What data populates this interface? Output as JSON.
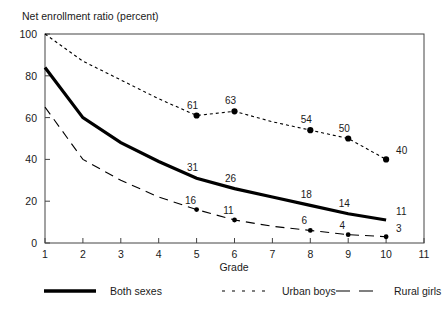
{
  "chart_data": {
    "type": "line",
    "title": "Net enrollment ratio (percent)",
    "xlabel": "Grade",
    "ylabel": "",
    "xlim": [
      1,
      11
    ],
    "ylim": [
      0,
      100
    ],
    "xticks": [
      "1",
      "2",
      "3",
      "4",
      "5",
      "6",
      "7",
      "8",
      "9",
      "10",
      "11"
    ],
    "yticks": [
      "0",
      "20",
      "40",
      "60",
      "80",
      "100"
    ],
    "grid": false,
    "legend_position": "bottom",
    "x": [
      1,
      2,
      3,
      4,
      5,
      6,
      7,
      8,
      9,
      10
    ],
    "series": [
      {
        "name": "Both sexes",
        "style": "solid",
        "width": "thick",
        "color": "#000000",
        "markers": false,
        "values": [
          84,
          60,
          48,
          39,
          31,
          26,
          22,
          18,
          14,
          11
        ],
        "labels": [
          {
            "x": 5,
            "value": 31
          },
          {
            "x": 6,
            "value": 26
          },
          {
            "x": 8,
            "value": 18
          },
          {
            "x": 9,
            "value": 14
          },
          {
            "x": 10,
            "value": 11
          }
        ]
      },
      {
        "name": "Urban boys",
        "style": "dotted",
        "width": "thin",
        "color": "#000000",
        "markers": true,
        "values": [
          100,
          87,
          78,
          69,
          61,
          63,
          58,
          54,
          50,
          40
        ],
        "labels": [
          {
            "x": 5,
            "value": 61
          },
          {
            "x": 6,
            "value": 63
          },
          {
            "x": 8,
            "value": 54
          },
          {
            "x": 9,
            "value": 50
          },
          {
            "x": 10,
            "value": 40
          }
        ]
      },
      {
        "name": "Rural girls",
        "style": "dashed",
        "width": "thin",
        "color": "#000000",
        "markers": true,
        "values": [
          65,
          40,
          30,
          22,
          16,
          11,
          8,
          6,
          4,
          3
        ],
        "labels": [
          {
            "x": 5,
            "value": 16
          },
          {
            "x": 6,
            "value": 11
          },
          {
            "x": 8,
            "value": 6
          },
          {
            "x": 9,
            "value": 4
          },
          {
            "x": 10,
            "value": 3
          }
        ]
      }
    ],
    "legend": [
      {
        "label": "Both sexes",
        "style": "solid"
      },
      {
        "label": "Urban boys",
        "style": "dotted"
      },
      {
        "label": "Rural girls",
        "style": "dashed"
      }
    ]
  }
}
